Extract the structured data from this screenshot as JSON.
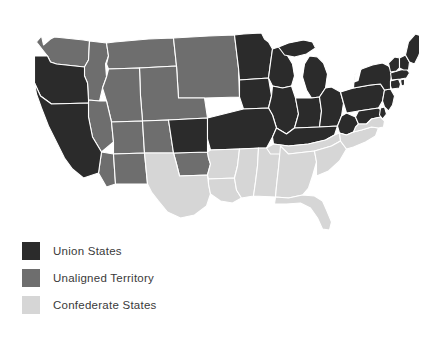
{
  "figure": {
    "background_color": "#ffffff"
  },
  "colors": {
    "union": "#2b2b2b",
    "unaligned": "#6e6e6e",
    "confederate": "#d6d6d6",
    "border": "#ffffff",
    "label_text": "#3a3a3a"
  },
  "legend": {
    "items": [
      {
        "label": "Union States",
        "color": "#2b2b2b",
        "category": "union"
      },
      {
        "label": "Unaligned Territory",
        "color": "#6e6e6e",
        "category": "unaligned"
      },
      {
        "label": "Confederate States",
        "color": "#d6d6d6",
        "category": "confederate"
      }
    ]
  },
  "map": {
    "projection_note": "contiguous United States",
    "categories": {
      "union": [
        "California",
        "Oregon",
        "Minnesota",
        "Iowa",
        "Wisconsin",
        "Illinois",
        "Michigan",
        "Indiana",
        "Ohio",
        "Kansas",
        "Missouri",
        "Kentucky",
        "West Virginia",
        "Maryland",
        "Delaware",
        "Pennsylvania",
        "New Jersey",
        "New York",
        "Connecticut",
        "Rhode Island",
        "Massachusetts",
        "Vermont",
        "New Hampshire",
        "Maine"
      ],
      "unaligned": [
        "Washington Territory",
        "Idaho Territory",
        "Montana Territory",
        "Dakota Territory",
        "Nebraska Territory",
        "Nevada",
        "Utah Territory",
        "Colorado Territory",
        "Arizona Territory",
        "New Mexico Territory",
        "Indian Territory"
      ],
      "confederate": [
        "Texas",
        "Arkansas",
        "Louisiana",
        "Mississippi",
        "Alabama",
        "Georgia",
        "Florida",
        "Tennessee",
        "South Carolina",
        "North Carolina",
        "Virginia"
      ]
    }
  }
}
